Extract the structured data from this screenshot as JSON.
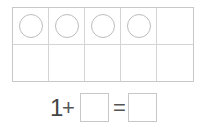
{
  "ten_frame": {
    "columns": 5,
    "rows": 2,
    "filled_counters": 4,
    "counter_color": "#bdbdbd"
  },
  "equation": {
    "addend1": "1",
    "plus": "+",
    "addend2": "",
    "equals": "=",
    "sum": ""
  }
}
